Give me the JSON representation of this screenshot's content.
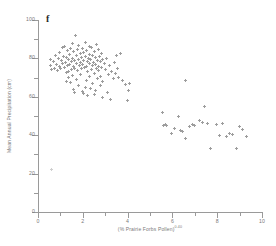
{
  "panel": {
    "letter": "f"
  },
  "axes": {
    "y_title": "Mean Annual Precipitation (cm)",
    "x_title_base": "(% Prairie Forbs Pollen)",
    "x_title_exponent": "0.40",
    "y_ticks": [
      0,
      20,
      40,
      60,
      80,
      100
    ],
    "y_minor_ticks": [
      10,
      30,
      50,
      70,
      90
    ],
    "x_ticks": [
      0,
      2,
      4,
      6,
      8,
      10
    ],
    "x_minor_ticks": [
      1,
      3,
      5,
      7,
      9
    ]
  },
  "colors": {
    "marker": "#9d9d9d",
    "axis": "#9a9a9a",
    "tick_label": "#7a7a7a",
    "panel_letter": "#2a2a2a",
    "background": "#ffffff"
  },
  "chart_data": {
    "type": "scatter",
    "title": "",
    "xlabel": "(% Prairie Forbs Pollen)^0.40",
    "ylabel": "Mean Annual Precipitation (cm)",
    "xlim": [
      0,
      10
    ],
    "ylim": [
      0,
      100
    ],
    "grid": false,
    "legend": null,
    "marker": "plus",
    "series": [
      {
        "name": "sites",
        "points": [
          [
            0.55,
            79.5
          ],
          [
            0.58,
            76.5
          ],
          [
            0.62,
            74.0
          ],
          [
            0.7,
            78.5
          ],
          [
            0.75,
            75.0
          ],
          [
            0.8,
            81.5
          ],
          [
            0.82,
            77.0
          ],
          [
            0.88,
            73.5
          ],
          [
            0.92,
            80.0
          ],
          [
            0.95,
            76.0
          ],
          [
            0.98,
            83.0
          ],
          [
            1.0,
            74.5
          ],
          [
            1.05,
            79.0
          ],
          [
            1.08,
            85.5
          ],
          [
            1.1,
            77.5
          ],
          [
            1.15,
            81.0
          ],
          [
            1.18,
            75.5
          ],
          [
            1.2,
            86.0
          ],
          [
            1.22,
            78.0
          ],
          [
            1.25,
            72.5
          ],
          [
            1.28,
            80.5
          ],
          [
            1.3,
            84.0
          ],
          [
            1.32,
            76.5
          ],
          [
            1.35,
            79.5
          ],
          [
            1.38,
            73.0
          ],
          [
            1.4,
            82.0
          ],
          [
            1.42,
            77.0
          ],
          [
            1.45,
            85.0
          ],
          [
            1.48,
            78.5
          ],
          [
            1.5,
            74.0
          ],
          [
            1.52,
            80.0
          ],
          [
            1.55,
            88.0
          ],
          [
            1.58,
            76.0
          ],
          [
            1.6,
            83.5
          ],
          [
            1.62,
            79.0
          ],
          [
            1.65,
            75.0
          ],
          [
            1.68,
            92.0
          ],
          [
            1.7,
            81.5
          ],
          [
            1.72,
            77.5
          ],
          [
            1.75,
            84.5
          ],
          [
            1.78,
            73.5
          ],
          [
            1.8,
            79.5
          ],
          [
            1.82,
            86.5
          ],
          [
            1.85,
            76.5
          ],
          [
            1.88,
            82.5
          ],
          [
            1.9,
            78.0
          ],
          [
            1.92,
            74.5
          ],
          [
            1.95,
            80.5
          ],
          [
            1.98,
            85.0
          ],
          [
            2.0,
            77.0
          ],
          [
            2.02,
            83.0
          ],
          [
            2.05,
            79.0
          ],
          [
            2.08,
            75.5
          ],
          [
            2.1,
            88.5
          ],
          [
            2.12,
            81.0
          ],
          [
            2.15,
            76.0
          ],
          [
            2.18,
            84.0
          ],
          [
            2.2,
            78.5
          ],
          [
            2.22,
            73.0
          ],
          [
            2.25,
            80.0
          ],
          [
            2.28,
            86.0
          ],
          [
            2.3,
            77.5
          ],
          [
            2.32,
            82.0
          ],
          [
            2.35,
            79.5
          ],
          [
            2.38,
            74.0
          ],
          [
            2.4,
            85.5
          ],
          [
            2.42,
            76.5
          ],
          [
            2.45,
            81.5
          ],
          [
            2.48,
            78.0
          ],
          [
            2.5,
            72.0
          ],
          [
            2.52,
            83.5
          ],
          [
            2.55,
            77.0
          ],
          [
            2.58,
            80.5
          ],
          [
            2.6,
            75.0
          ],
          [
            2.62,
            87.0
          ],
          [
            2.65,
            79.0
          ],
          [
            2.68,
            73.5
          ],
          [
            2.7,
            84.5
          ],
          [
            2.72,
            76.0
          ],
          [
            2.75,
            81.0
          ],
          [
            2.78,
            78.5
          ],
          [
            2.8,
            70.5
          ],
          [
            2.82,
            82.5
          ],
          [
            2.85,
            75.5
          ],
          [
            2.88,
            79.5
          ],
          [
            2.9,
            68.0
          ],
          [
            2.95,
            77.5
          ],
          [
            3.0,
            74.0
          ],
          [
            3.05,
            80.0
          ],
          [
            3.1,
            62.0
          ],
          [
            3.15,
            71.5
          ],
          [
            3.2,
            76.5
          ],
          [
            3.25,
            58.5
          ],
          [
            3.3,
            73.0
          ],
          [
            3.35,
            69.5
          ],
          [
            3.4,
            78.0
          ],
          [
            3.45,
            72.0
          ],
          [
            3.5,
            81.5
          ],
          [
            3.55,
            75.0
          ],
          [
            3.6,
            70.0
          ],
          [
            3.7,
            82.5
          ],
          [
            3.75,
            68.5
          ],
          [
            3.9,
            66.5
          ],
          [
            4.0,
            58.0
          ],
          [
            4.05,
            63.5
          ],
          [
            4.1,
            67.0
          ],
          [
            1.6,
            64.0
          ],
          [
            1.65,
            62.5
          ],
          [
            1.8,
            66.0
          ],
          [
            2.0,
            63.0
          ],
          [
            2.05,
            61.5
          ],
          [
            2.1,
            65.0
          ],
          [
            2.2,
            60.5
          ],
          [
            2.35,
            64.5
          ],
          [
            2.5,
            61.0
          ],
          [
            2.55,
            63.5
          ],
          [
            2.9,
            59.5
          ],
          [
            1.25,
            68.0
          ],
          [
            1.35,
            70.0
          ],
          [
            1.45,
            67.5
          ],
          [
            1.55,
            71.0
          ],
          [
            1.7,
            69.0
          ],
          [
            1.9,
            71.5
          ],
          [
            2.15,
            68.5
          ],
          [
            2.3,
            70.5
          ],
          [
            2.45,
            67.0
          ],
          [
            2.65,
            69.5
          ],
          [
            2.8,
            66.0
          ],
          [
            5.55,
            52.0
          ],
          [
            5.7,
            45.5
          ],
          [
            5.75,
            45.0
          ],
          [
            5.95,
            41.0
          ],
          [
            6.1,
            43.5
          ],
          [
            6.25,
            50.0
          ],
          [
            6.35,
            42.5
          ],
          [
            6.45,
            42.0
          ],
          [
            6.6,
            38.5
          ],
          [
            6.75,
            44.5
          ],
          [
            6.9,
            45.5
          ],
          [
            7.0,
            45.0
          ],
          [
            7.2,
            47.5
          ],
          [
            7.35,
            46.5
          ],
          [
            7.45,
            55.0
          ],
          [
            7.55,
            46.0
          ],
          [
            7.7,
            33.0
          ],
          [
            7.95,
            45.5
          ],
          [
            8.1,
            40.0
          ],
          [
            8.25,
            46.0
          ],
          [
            8.4,
            39.5
          ],
          [
            8.55,
            41.0
          ],
          [
            8.7,
            40.5
          ],
          [
            8.85,
            33.0
          ],
          [
            9.0,
            44.5
          ],
          [
            9.15,
            43.0
          ],
          [
            9.3,
            39.5
          ],
          [
            6.6,
            68.5
          ],
          [
            5.6,
            45.0
          ],
          [
            0.62,
            22.0
          ]
        ]
      }
    ]
  }
}
